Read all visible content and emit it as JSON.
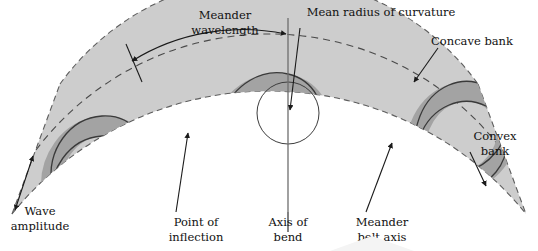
{
  "figure": {
    "background_color": "#ffffff",
    "belt_color": "#cdcdcd",
    "channel_color": "#a3a3a3",
    "line_color": "#3a3a3a"
  },
  "labels": {
    "meander_wavelength": {
      "line1": "Meander",
      "line2": "wavelength"
    },
    "mean_radius": {
      "line1": "Mean radius of curvature"
    },
    "concave_bank": {
      "line1": "Concave bank"
    },
    "convex_bank": {
      "line1": "Convex",
      "line2": "bank"
    },
    "wave_amplitude": {
      "line1": "Wave",
      "line2": "amplitude"
    },
    "point_of_inflection": {
      "line1": "Point of",
      "line2": "inflection"
    },
    "axis_of_bend": {
      "line1": "Axis of",
      "line2": "bend"
    },
    "meander_belt_axis": {
      "line1": "Meander",
      "line2": "belt axis"
    }
  }
}
